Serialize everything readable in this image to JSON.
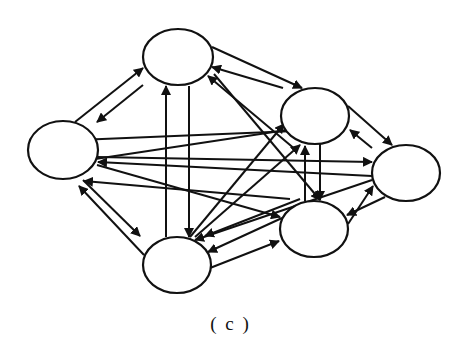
{
  "figure": {
    "caption": "( c )",
    "stroke_color": "#111111",
    "fill_color": "#ffffff"
  },
  "nodes": [
    {
      "id": "A",
      "cx": 178,
      "cy": 57,
      "rx": 35,
      "ry": 28
    },
    {
      "id": "B",
      "cx": 63,
      "cy": 150,
      "rx": 35,
      "ry": 29
    },
    {
      "id": "C",
      "cx": 315,
      "cy": 116,
      "rx": 34,
      "ry": 28
    },
    {
      "id": "D",
      "cx": 406,
      "cy": 173,
      "rx": 34,
      "ry": 28
    },
    {
      "id": "E",
      "cx": 314,
      "cy": 229,
      "rx": 34,
      "ry": 28
    },
    {
      "id": "F",
      "cx": 177,
      "cy": 265,
      "rx": 34,
      "ry": 28
    }
  ],
  "edges": [
    {
      "x1": 75,
      "y1": 122,
      "x2": 143,
      "y2": 68
    },
    {
      "x1": 143,
      "y1": 85,
      "x2": 97,
      "y2": 122
    },
    {
      "x1": 212,
      "y1": 47,
      "x2": 302,
      "y2": 88
    },
    {
      "x1": 283,
      "y1": 88,
      "x2": 212,
      "y2": 67
    },
    {
      "x1": 348,
      "y1": 106,
      "x2": 392,
      "y2": 145
    },
    {
      "x1": 372,
      "y1": 148,
      "x2": 350,
      "y2": 130
    },
    {
      "x1": 385,
      "y1": 197,
      "x2": 347,
      "y2": 215
    },
    {
      "x1": 282,
      "y1": 218,
      "x2": 208,
      "y2": 252
    },
    {
      "x1": 210,
      "y1": 268,
      "x2": 279,
      "y2": 241
    },
    {
      "x1": 144,
      "y1": 255,
      "x2": 79,
      "y2": 186
    },
    {
      "x1": 83,
      "y1": 180,
      "x2": 140,
      "y2": 236
    },
    {
      "x1": 166,
      "y1": 237,
      "x2": 166,
      "y2": 86
    },
    {
      "x1": 189,
      "y1": 86,
      "x2": 189,
      "y2": 237
    },
    {
      "x1": 295,
      "y1": 131,
      "x2": 78,
      "y2": 140
    },
    {
      "x1": 300,
      "y1": 128,
      "x2": 82,
      "y2": 161
    },
    {
      "x1": 97,
      "y1": 157,
      "x2": 372,
      "y2": 162
    },
    {
      "x1": 372,
      "y1": 176,
      "x2": 98,
      "y2": 162
    },
    {
      "x1": 97,
      "y1": 165,
      "x2": 280,
      "y2": 217
    },
    {
      "x1": 290,
      "y1": 199,
      "x2": 84,
      "y2": 181
    },
    {
      "x1": 214,
      "y1": 74,
      "x2": 320,
      "y2": 200
    },
    {
      "x1": 296,
      "y1": 150,
      "x2": 208,
      "y2": 76
    },
    {
      "x1": 320,
      "y1": 144,
      "x2": 320,
      "y2": 200
    },
    {
      "x1": 305,
      "y1": 201,
      "x2": 305,
      "y2": 146
    },
    {
      "x1": 190,
      "y1": 237,
      "x2": 284,
      "y2": 124
    },
    {
      "x1": 195,
      "y1": 237,
      "x2": 300,
      "y2": 145
    },
    {
      "x1": 372,
      "y1": 180,
      "x2": 195,
      "y2": 240
    },
    {
      "x1": 300,
      "y1": 199,
      "x2": 205,
      "y2": 236
    },
    {
      "x1": 348,
      "y1": 224,
      "x2": 373,
      "y2": 186
    }
  ]
}
